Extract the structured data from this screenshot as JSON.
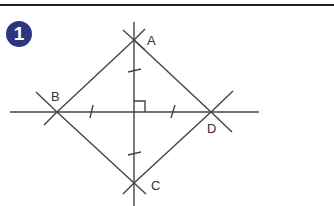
{
  "step": {
    "number": "1",
    "badge_color": "#2e3580"
  },
  "diagram": {
    "points": [
      {
        "label": "A",
        "x": 134,
        "y": 40
      },
      {
        "label": "B",
        "x": 57,
        "y": 112
      },
      {
        "label": "C",
        "x": 134,
        "y": 183
      },
      {
        "label": "D",
        "x": 211,
        "y": 112
      }
    ],
    "labels": {
      "A": "A",
      "B": "B",
      "C": "C",
      "D": "D"
    },
    "line_color": "#444444"
  }
}
